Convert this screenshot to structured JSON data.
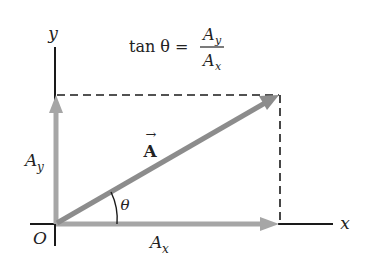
{
  "diagram": {
    "formula": {
      "lhs": "tan θ =",
      "numerator": "A",
      "numerator_sub": "y",
      "denominator": "A",
      "denominator_sub": "x"
    },
    "axes": {
      "x_label": "x",
      "y_label": "y",
      "origin_label": "O"
    },
    "vector": {
      "label": "A",
      "arrow_symbol": "→"
    },
    "components": {
      "x_label": "A",
      "x_sub": "x",
      "y_label": "A",
      "y_sub": "y"
    },
    "angle_label": "θ",
    "colors": {
      "axis": "#1a1a1a",
      "vector": "#8c8c8c",
      "component": "#a6a6a6",
      "dashed": "#1a1a1a"
    }
  }
}
